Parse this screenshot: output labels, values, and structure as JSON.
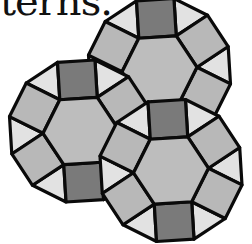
{
  "caption": {
    "text": "terns."
  },
  "diagram": {
    "colors": {
      "hexagon": "#bdbdbd",
      "square_dark": "#7a7a7a",
      "square_light": "#b8b8b8",
      "triangle": "#e2e2e2",
      "stroke": "#0a0a0a"
    },
    "stroke_width": 3.2,
    "side": 37.5,
    "rotation_deg": -3.5,
    "units": [
      {
        "name": "top-unit",
        "cx": 159.5,
        "cy": 69.5
      },
      {
        "name": "left-unit",
        "cx": 80.5,
        "cy": 131
      },
      {
        "name": "bottom-right-unit",
        "cx": 171,
        "cy": 170.5
      }
    ]
  }
}
